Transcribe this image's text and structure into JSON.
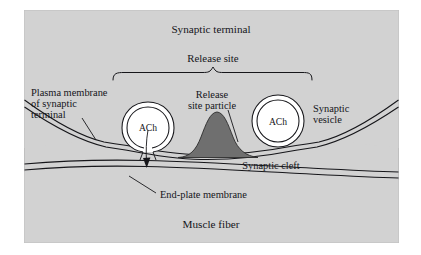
{
  "figure": {
    "panel": {
      "background_color": "#d2d2d2",
      "border_color": "#b8b8b8",
      "page_background": "#ffffff"
    },
    "regions": {
      "synaptic_terminal_label": "Synaptic terminal",
      "muscle_fiber_label": "Muscle fiber",
      "cleft_label": "Synaptic cleft"
    },
    "bracket": {
      "label": "Release site"
    },
    "labels": {
      "plasma_membrane": {
        "line1": "Plasma membrane",
        "line2": "of synaptic",
        "line3": "terminal"
      },
      "release_site_particle": {
        "line1": "Release",
        "line2": "site particle"
      },
      "synaptic_vesicle": {
        "line1": "Synaptic",
        "line2": "vesicle"
      },
      "end_plate_membrane": "End-plate membrane"
    },
    "vesicles": {
      "fusing": {
        "neurotransmitter": "ACh"
      },
      "intact": {
        "neurotransmitter": "ACh"
      }
    },
    "particle": {
      "fill_color": "#6f6f6f",
      "stroke_color": "#2a2a2a"
    },
    "line_color": "#16161a"
  }
}
